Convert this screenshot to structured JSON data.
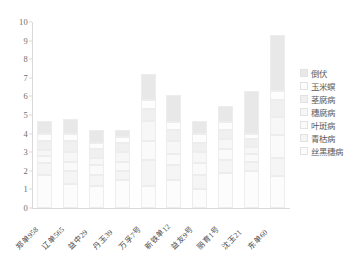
{
  "chart_data": {
    "type": "bar",
    "stacked": true,
    "title": "",
    "xlabel": "",
    "ylabel": "",
    "ylim": [
      0,
      10
    ],
    "ytick_values": [
      0,
      1,
      2,
      3,
      4,
      5,
      6,
      7,
      8,
      9,
      10
    ],
    "grid": false,
    "legend_position": "right",
    "categories": [
      "郑单958",
      "辽单565",
      "益中29",
      "丹玉39",
      "万孚7号",
      "新铁单12",
      "益友9号",
      "丽育1号",
      "沈玉21",
      "东单60"
    ],
    "series": [
      {
        "name": "丝黑穗病",
        "color": "#fcfcfc",
        "values": [
          1.8,
          1.3,
          1.2,
          1.5,
          1.2,
          1.5,
          1.0,
          1.9,
          2.0,
          1.7
        ]
      },
      {
        "name": "青枯病",
        "color": "#f5f5f5",
        "values": [
          0.6,
          0.7,
          0.6,
          0.5,
          1.4,
          0.8,
          0.8,
          0.7,
          0.5,
          1.0
        ]
      },
      {
        "name": "叶斑病",
        "color": "#fafafa",
        "values": [
          0.4,
          0.5,
          0.5,
          0.5,
          1.0,
          0.6,
          0.6,
          0.6,
          0.4,
          1.2
        ]
      },
      {
        "name": "穗腐病",
        "color": "#f7f7f7",
        "values": [
          0.3,
          0.5,
          0.4,
          0.5,
          1.1,
          0.7,
          0.6,
          0.5,
          0.4,
          1.0
        ]
      },
      {
        "name": "茎腐病",
        "color": "#f0f0f0",
        "values": [
          0.5,
          0.6,
          0.5,
          0.5,
          0.6,
          0.6,
          0.5,
          0.5,
          0.4,
          0.9
        ]
      },
      {
        "name": "玉米螟",
        "color": "#fdfdfd",
        "values": [
          0.4,
          0.4,
          0.3,
          0.3,
          0.5,
          0.4,
          0.5,
          0.4,
          0.3,
          0.5
        ]
      },
      {
        "name": "倒伏",
        "color": "#e8e8e8",
        "values": [
          0.7,
          0.8,
          0.7,
          0.4,
          1.4,
          1.5,
          0.7,
          0.9,
          2.3,
          3.0
        ]
      }
    ],
    "totals": [
      4.7,
      4.8,
      4.2,
      4.2,
      7.2,
      6.1,
      4.7,
      5.5,
      6.3,
      9.3
    ]
  },
  "legend": {
    "items": [
      {
        "label": "倒伏"
      },
      {
        "label": "玉米螟"
      },
      {
        "label": "茎腐病"
      },
      {
        "label": "穗腐病"
      },
      {
        "label": "叶斑病"
      },
      {
        "label": "青枯病"
      },
      {
        "label": "丝黑穗病"
      }
    ]
  },
  "colors": {
    "axis": "#d9d9d9",
    "tick_text": "#6e6e6e",
    "label_text": "#4a4a4a",
    "background": "#ffffff"
  }
}
